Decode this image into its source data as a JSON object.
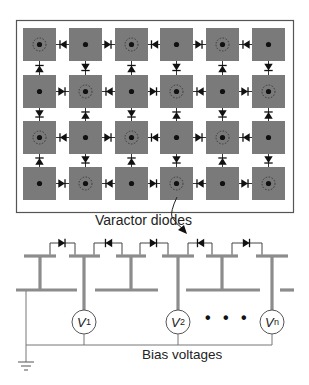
{
  "figure": {
    "colors": {
      "patch_fill": "#7a7a7a",
      "frame_stroke": "#555555",
      "diode": "#111111",
      "bias_line": "#8c8c8c",
      "thin_wire": "#777777",
      "background": "#ffffff"
    }
  },
  "array": {
    "rows": 4,
    "cols": 6,
    "highlight_pattern": "checkerboard (row+col even has dotted ring)",
    "highlighted": [
      [
        true,
        false,
        true,
        false,
        true,
        false
      ],
      [
        false,
        true,
        false,
        true,
        false,
        true
      ],
      [
        true,
        false,
        true,
        false,
        true,
        false
      ],
      [
        false,
        true,
        false,
        true,
        false,
        true
      ]
    ],
    "horizontal_diodes": [
      [
        "left",
        "right",
        "left",
        "right",
        "left"
      ],
      [
        "right",
        "left",
        "right",
        "left",
        "right"
      ],
      [
        "left",
        "right",
        "left",
        "right",
        "left"
      ],
      [
        "right",
        "left",
        "right",
        "left",
        "right"
      ]
    ],
    "vertical_diodes": [
      [
        "up",
        "down",
        "up",
        "down",
        "up",
        "down"
      ],
      [
        "down",
        "up",
        "down",
        "up",
        "down",
        "up"
      ],
      [
        "up",
        "down",
        "up",
        "down",
        "up",
        "down"
      ]
    ]
  },
  "labels": {
    "varactor": "Varactor diodes",
    "bias": "Bias voltages",
    "ellipsis": "• • •"
  },
  "sources": [
    {
      "symbol": "V",
      "subscript": "1"
    },
    {
      "symbol": "V",
      "subscript": "2"
    },
    {
      "symbol": "V",
      "subscript": "n"
    }
  ],
  "circuit": {
    "diode_directions": [
      "right",
      "left",
      "right",
      "left",
      "right"
    ]
  }
}
